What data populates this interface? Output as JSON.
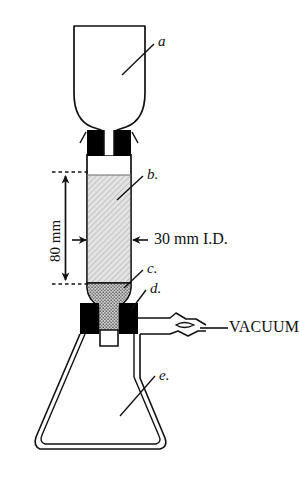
{
  "figure": {
    "background_color": "#ffffff",
    "line_color": "#111111",
    "fill_packing": "#d8d8d8",
    "fill_stopper": "#000000",
    "fill_frit": "#b9b9b9"
  },
  "labels": {
    "part_a": "a",
    "part_b": "b.",
    "part_c": "c.",
    "part_d": "d.",
    "part_e": "e.",
    "height_dimension": "80 mm",
    "diameter_dimension": "30 mm I.D.",
    "vacuum": "VACUUM"
  },
  "measurements": {
    "column_height": "80 mm",
    "column_inner_diameter": "30 mm I.D."
  },
  "parts": {
    "a": "reservoir funnel",
    "b": "packed column bed",
    "c": "glass frit",
    "d": "rubber stopper",
    "e": "filtering flask"
  }
}
